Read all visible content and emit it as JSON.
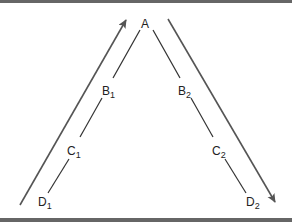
{
  "diagram": {
    "apex_label": "A",
    "left_labels": [
      {
        "base": "B",
        "sub": "1"
      },
      {
        "base": "C",
        "sub": "1"
      },
      {
        "base": "D",
        "sub": "1"
      }
    ],
    "right_labels": [
      {
        "base": "B",
        "sub": "2"
      },
      {
        "base": "C",
        "sub": "2"
      },
      {
        "base": "D",
        "sub": "2"
      }
    ],
    "left_arrow_direction": "up",
    "right_arrow_direction": "down",
    "colors": {
      "line": "#333333",
      "arrow": "#555555",
      "border": "#666666"
    }
  }
}
